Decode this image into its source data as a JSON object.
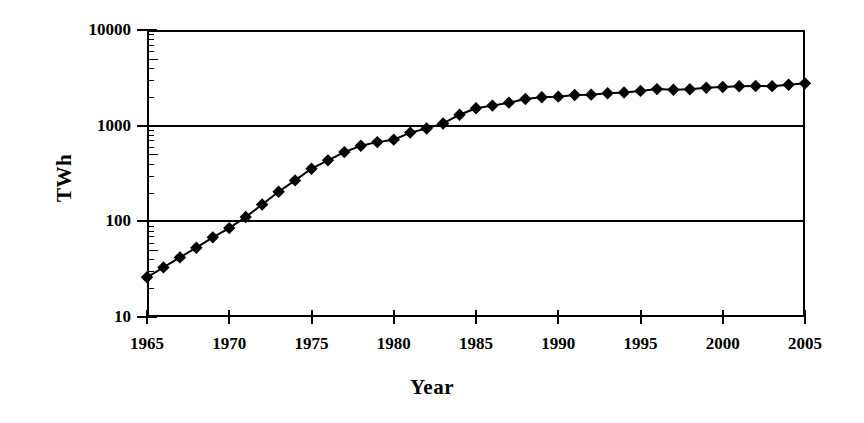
{
  "chart_data": {
    "type": "line",
    "title": "",
    "xlabel": "Year",
    "ylabel": "TWh",
    "yscale": "log",
    "ylim": [
      10,
      10000
    ],
    "xlim": [
      1965,
      2005
    ],
    "grid": true,
    "legend": null,
    "marker": "diamond",
    "marker_color": "#000000",
    "line_color": "#000000",
    "y_ticklabels": [
      "10000",
      "1000",
      "100",
      "10"
    ],
    "y_tickvalues": [
      10000,
      1000,
      100,
      10
    ],
    "x_ticklabels": [
      "1965",
      "1970",
      "1975",
      "1980",
      "1985",
      "1990",
      "1995",
      "2000",
      "2005"
    ],
    "x_tickvalues": [
      1965,
      1970,
      1975,
      1980,
      1985,
      1990,
      1995,
      2000,
      2005
    ],
    "x": [
      1965,
      1966,
      1967,
      1968,
      1969,
      1970,
      1971,
      1972,
      1973,
      1974,
      1975,
      1976,
      1977,
      1978,
      1979,
      1980,
      1981,
      1982,
      1983,
      1984,
      1985,
      1986,
      1987,
      1988,
      1989,
      1990,
      1991,
      1992,
      1993,
      1994,
      1995,
      1996,
      1997,
      1998,
      1999,
      2000,
      2001,
      2002,
      2003,
      2004,
      2005
    ],
    "values": [
      26,
      33,
      42,
      53,
      68,
      85,
      111,
      150,
      204,
      268,
      355,
      434,
      529,
      617,
      673,
      714,
      846,
      935,
      1055,
      1300,
      1520,
      1620,
      1740,
      1900,
      1980,
      2010,
      2090,
      2110,
      2180,
      2220,
      2310,
      2410,
      2370,
      2400,
      2490,
      2540,
      2580,
      2600,
      2590,
      2680,
      2770
    ]
  },
  "axes": {
    "y_title": "TWh",
    "x_title": "Year"
  }
}
